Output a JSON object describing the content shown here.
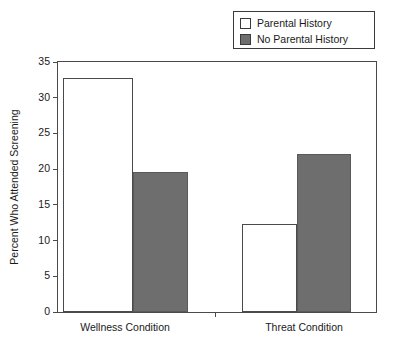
{
  "chart_data": {
    "type": "bar",
    "title": "",
    "xlabel": "",
    "ylabel": "Percent Who Attended Screening",
    "categories": [
      "Wellness Condition",
      "Threat Condition"
    ],
    "series": [
      {
        "name": "Parental History",
        "values": [
          32.8,
          12.3
        ],
        "color": "#ffffff"
      },
      {
        "name": "No Parental History",
        "values": [
          19.6,
          22.1
        ],
        "color": "#6e6e6e"
      }
    ],
    "ylim": [
      0,
      35
    ],
    "yticks": [
      0,
      5,
      10,
      15,
      20,
      25,
      30,
      35
    ],
    "ytick_labels": [
      "0",
      "5",
      "10",
      "15",
      "20",
      "25",
      "30",
      "35"
    ],
    "grid": false,
    "legend_position": "top-right"
  },
  "legend": {
    "entries": [
      {
        "label": "Parental History",
        "swatch": "open-square"
      },
      {
        "label": "No Parental History",
        "swatch": "filled-square"
      }
    ]
  },
  "axes": {
    "y_title": "Percent Who Attended Screening",
    "x_group_labels": [
      "Wellness Condition",
      "Threat Condition"
    ]
  },
  "colors": {
    "bar_fill_gray": "#6e6e6e",
    "bar_fill_white": "#ffffff",
    "axis_line": "#4a4a4a",
    "text": "#1a1a1a"
  }
}
